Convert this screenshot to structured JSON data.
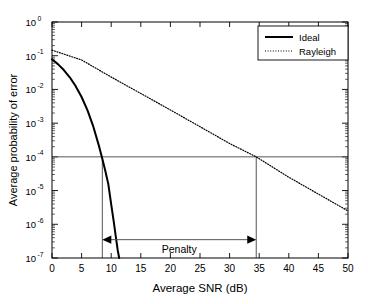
{
  "chart_data": {
    "type": "line",
    "title": "",
    "xlabel": "Average SNR (dB)",
    "ylabel": "Average probability of error",
    "xlim": [
      0,
      50
    ],
    "ylim": [
      1e-07,
      1
    ],
    "yscale": "log",
    "xscale": "linear",
    "grid": false,
    "legend_position": "top-right",
    "xticks": [
      0,
      5,
      10,
      15,
      20,
      25,
      30,
      35,
      40,
      45,
      50
    ],
    "xticklabels": [
      "0",
      "5",
      "10",
      "15",
      "20",
      "25",
      "30",
      "35",
      "40",
      "45",
      "50"
    ],
    "yticks": [
      1,
      0.1,
      0.01,
      0.001,
      0.0001,
      1e-05,
      1e-06,
      1e-07
    ],
    "yticklabels": [
      "10^0",
      "10^-1",
      "10^-2",
      "10^-3",
      "10^-4",
      "10^-5",
      "10^-6",
      "10^-7"
    ],
    "ytick_mantissa": [
      "10",
      "10",
      "10",
      "10",
      "10",
      "10",
      "10",
      "10"
    ],
    "ytick_exponents": [
      "0",
      "-1",
      "-2",
      "-3",
      "-4",
      "-5",
      "-6",
      "-7"
    ],
    "series": [
      {
        "name": "Ideal",
        "style": "solid",
        "color": "#000000",
        "width": 2.0,
        "x": [
          0,
          1,
          2,
          3,
          4,
          5,
          6,
          7,
          8,
          8.5,
          9,
          9.5,
          10,
          10.4,
          10.8,
          11.1,
          11.35
        ],
        "y": [
          0.0786,
          0.0563,
          0.0375,
          0.0229,
          0.0125,
          0.00595,
          0.0024,
          0.000773,
          0.000191,
          8.86e-05,
          3.89e-05,
          1.6e-05,
          3.9e-06,
          1.31e-06,
          4e-07,
          1.7e-07,
          1e-07
        ]
      },
      {
        "name": "Rayleigh",
        "style": "dotted",
        "color": "#000000",
        "width": 1.2,
        "x": [
          0,
          5,
          10,
          15,
          20,
          25,
          30,
          34.5,
          40,
          45,
          50
        ],
        "y": [
          0.1464,
          0.0747,
          0.0233,
          0.00758,
          0.00246,
          0.000785,
          0.000249,
          0.0001,
          2.49e-05,
          7.87e-06,
          2.49e-06
        ]
      }
    ],
    "legend": [
      {
        "label": "Ideal",
        "style": "solid"
      },
      {
        "label": "Rayleigh",
        "style": "dotted"
      }
    ],
    "annotations": [
      {
        "name": "penalty-marker",
        "label": "Penalty",
        "type": "double-arrow",
        "x_start": 8.5,
        "x_end": 34.5,
        "y": 3.5e-07
      },
      {
        "name": "reference-level-line",
        "type": "hline",
        "y": 0.0001
      },
      {
        "name": "ideal-dropline",
        "type": "vline",
        "x": 8.5,
        "y_from": 0.0001,
        "y_to": 1e-07
      },
      {
        "name": "rayleigh-dropline",
        "type": "vline",
        "x": 34.5,
        "y_from": 0.0001,
        "y_to": 1e-07
      }
    ],
    "colors": {
      "axis": "#000000",
      "curve": "#000000",
      "annotation": "#555555",
      "background": "#ffffff"
    }
  }
}
